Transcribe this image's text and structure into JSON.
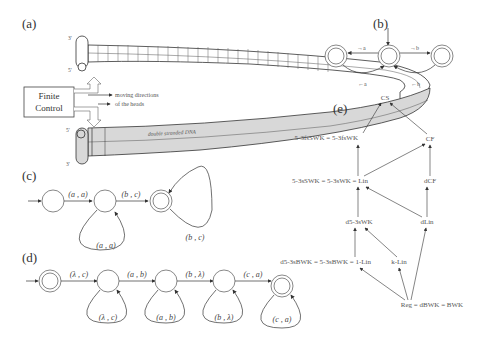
{
  "panels": {
    "a": {
      "label": "(a)",
      "finite_control": [
        "Finite",
        "Control"
      ],
      "annotation_line1": "moving directions",
      "annotation_line2": "of the heads",
      "tape_label": "double stranded DNA",
      "top_strand_left_top": "3'",
      "top_strand_left_bottom": "5'",
      "bottom_strand_left_top": "5'",
      "bottom_strand_left_bottom": "3'"
    },
    "b": {
      "label": "(b)",
      "edges": {
        "to_left": "→a",
        "from_left": "←a",
        "to_right": "→b",
        "from_right": "←b"
      }
    },
    "c": {
      "label": "(c)",
      "edges": [
        "(a , a)",
        "(b , c)"
      ],
      "loops": [
        "(a , a)",
        "(b , c)"
      ]
    },
    "d": {
      "label": "(d)",
      "edges": [
        "(λ , c)",
        "(a , b)",
        "(b , λ)",
        "(c , a)"
      ],
      "loops": [
        "(λ , c)",
        "(a , b)",
        "(b , λ)",
        "(c , a)"
      ]
    },
    "e": {
      "label": "(e)",
      "nodes": {
        "cs": "CS",
        "top_left": "5-3fsSWK = 5-3fsWK",
        "cf": "CF",
        "mid_left": "5-3sSWK = 5-3sWK = Lin",
        "dcf": "dCF",
        "d53": "d5-3sWK",
        "dlin": "dLin",
        "bottom_left": "d5-3sBWK = 5-3sBWK = 1-Lin",
        "klin": "k-Lin",
        "reg": "Reg = dBWK = BWK"
      }
    }
  }
}
